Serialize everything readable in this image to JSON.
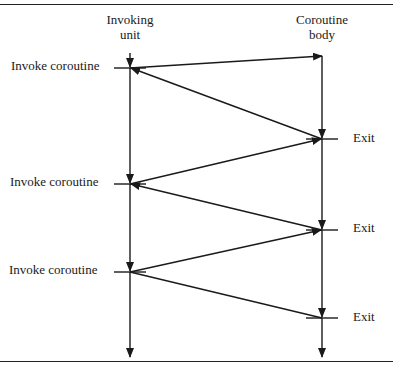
{
  "columns": {
    "invoking": {
      "line1": "Invoking",
      "line2": "unit"
    },
    "coroutine": {
      "line1": "Coroutine",
      "line2": "body"
    }
  },
  "events": {
    "invoke": [
      "Invoke coroutine",
      "Invoke coroutine",
      "Invoke coroutine"
    ],
    "exit": [
      "Exit",
      "Exit",
      "Exit"
    ]
  },
  "colors": {
    "line": "#1a1a1a",
    "background": "#ffffff"
  }
}
